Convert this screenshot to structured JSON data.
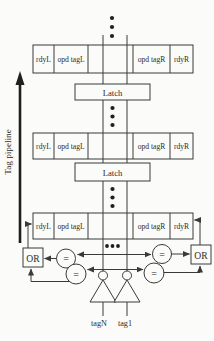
{
  "figure": {
    "pipeline_label": "Tag pipeline",
    "cell_labels": [
      "rdyL",
      "opd tagL",
      "opd tagR",
      "rdyR"
    ],
    "latch_label": "Latch",
    "or_gate_label": "OR",
    "comparator_symbol": "=",
    "driver_labels": [
      "tagN",
      "tag1"
    ],
    "colors": {
      "line": "#3a3a3a",
      "text": "#2b2b2b",
      "background": "#fbfbf9"
    }
  }
}
